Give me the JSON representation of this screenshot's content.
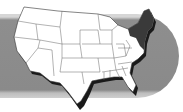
{
  "image": {
    "subject": "map of the contiguous United States",
    "highlight_region": "northeastern states",
    "colors": {
      "background": "#ffffff",
      "band": "#8a8a8a",
      "band_edge": "#d6d6d6",
      "states_fill": "#ffffff",
      "highlight_fill": "#3a3a3a",
      "shadow": "#1a1a1a",
      "state_borders": "#555555"
    }
  }
}
